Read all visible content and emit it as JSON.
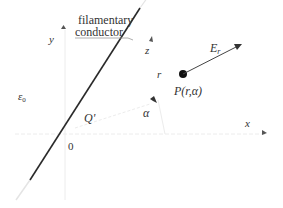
{
  "diagram": {
    "callout": {
      "line1": "filamentary",
      "line2": "conductor"
    },
    "labels": {
      "y_axis": "y",
      "x_axis": "x",
      "z_axis": "z",
      "origin": "0",
      "charge": "Q'",
      "permittivity": "ε",
      "permittivity_sub": "0",
      "radius": "r",
      "angle": "α",
      "field": "E",
      "field_sub": "r",
      "point": "P(r,α)"
    },
    "colors": {
      "conductor": "#2a2a2a",
      "axes": "#e6e6e6",
      "arrow": "#444444",
      "text": "#333333"
    }
  }
}
